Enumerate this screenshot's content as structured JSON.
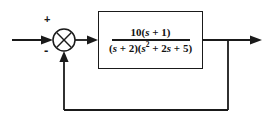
{
  "diagram": {
    "kind": "closed-loop-feedback-block-diagram",
    "background_color": "#ffffff",
    "line_color": "#1a1a1a",
    "text_color": "#111111"
  },
  "summing_junction": {
    "name": "summing-junction",
    "shape": "circle-with-cross",
    "center_x": 64,
    "center_y": 40,
    "radius": 11,
    "positive_sign": "+",
    "negative_sign": "-"
  },
  "transfer_function": {
    "numerator": "10(s + 1)",
    "numerator_coefficient": "10",
    "numerator_factor": "(s + 1)",
    "denominator": "(s + 2)(s² + 2s + 5)",
    "denominator_factor_1": "(s + 2)",
    "denominator_factor_2": "(s² + 2s + 5)",
    "denom_part_a": "(",
    "denom_part_b": " + 2)(",
    "denom_exponent": "2",
    "denom_part_c": " + 2",
    "denom_part_d": " + 5)"
  },
  "signals": {
    "input_label": "",
    "output_label": "",
    "feedback_gain": "1"
  },
  "geometry": {
    "input_line": {
      "x1": 12,
      "y1": 40,
      "x2": 53,
      "y2": 40
    },
    "junction_to_block": {
      "x1": 75,
      "y1": 40,
      "x2": 98,
      "y2": 40
    },
    "block_to_output": {
      "x1": 203,
      "y1": 40,
      "x2": 262,
      "y2": 40
    },
    "feedback_tap_x": 228,
    "feedback_bottom_y": 110,
    "feedback_riser_x": 64,
    "block_rect": {
      "x": 98,
      "y": 11,
      "w": 105,
      "h": 58
    }
  }
}
